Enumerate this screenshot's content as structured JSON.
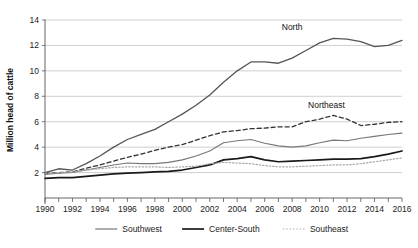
{
  "chart_data": {
    "type": "line",
    "title": "",
    "xlabel": "",
    "ylabel": "Million head of cattle",
    "xlim": [
      1990,
      2016
    ],
    "ylim": [
      0,
      14
    ],
    "yticks": [
      2,
      4,
      6,
      8,
      10,
      12,
      14
    ],
    "xticks": [
      1990,
      1992,
      1994,
      1996,
      1998,
      2000,
      2002,
      2004,
      2006,
      2008,
      2010,
      2012,
      2014,
      2016
    ],
    "grid": "horizontal",
    "legend_position": "bottom",
    "x": [
      1990,
      1991,
      1992,
      1993,
      1994,
      1995,
      1996,
      1997,
      1998,
      1999,
      2000,
      2001,
      2002,
      2003,
      2004,
      2005,
      2006,
      2007,
      2008,
      2009,
      2010,
      2011,
      2012,
      2013,
      2014,
      2015,
      2016
    ],
    "series": [
      {
        "name": "North",
        "label_in_chart": "North",
        "color": "#555555",
        "style": "solid",
        "width": 1.3,
        "values": [
          2.0,
          2.3,
          2.2,
          2.7,
          3.3,
          4.0,
          4.6,
          5.0,
          5.4,
          6.0,
          6.6,
          7.3,
          8.1,
          9.1,
          10.0,
          10.7,
          10.7,
          10.6,
          11.0,
          11.6,
          12.2,
          12.55,
          12.5,
          12.3,
          11.9,
          12.0,
          12.4
        ]
      },
      {
        "name": "Northeast",
        "label_in_chart": "Northeast",
        "color": "#333333",
        "style": "dashed",
        "width": 1.3,
        "values": [
          1.95,
          2.0,
          2.05,
          2.35,
          2.6,
          2.9,
          3.2,
          3.45,
          3.75,
          4.0,
          4.2,
          4.55,
          4.9,
          5.2,
          5.3,
          5.45,
          5.5,
          5.6,
          5.6,
          6.0,
          6.2,
          6.5,
          6.2,
          5.7,
          5.8,
          5.95,
          6.0
        ]
      },
      {
        "name": "Southwest",
        "color": "#777777",
        "style": "solid",
        "width": 1.1,
        "values": [
          1.85,
          1.95,
          2.0,
          2.2,
          2.4,
          2.6,
          2.75,
          2.7,
          2.7,
          2.8,
          3.0,
          3.3,
          3.7,
          4.35,
          4.5,
          4.6,
          4.3,
          4.1,
          4.0,
          4.1,
          4.35,
          4.55,
          4.5,
          4.7,
          4.85,
          5.0,
          5.1
        ]
      },
      {
        "name": "Center-South",
        "color": "#1a1a1a",
        "style": "solid",
        "width": 1.7,
        "values": [
          1.55,
          1.6,
          1.6,
          1.7,
          1.8,
          1.9,
          1.95,
          2.0,
          2.05,
          2.1,
          2.2,
          2.4,
          2.6,
          3.0,
          3.1,
          3.25,
          3.0,
          2.85,
          2.9,
          2.95,
          3.0,
          3.05,
          3.05,
          3.1,
          3.25,
          3.45,
          3.7
        ]
      },
      {
        "name": "Southeast",
        "color": "#a8a8a8",
        "style": "dotted",
        "width": 1.2,
        "values": [
          1.95,
          2.0,
          2.05,
          2.2,
          2.3,
          2.4,
          2.45,
          2.45,
          2.45,
          2.4,
          2.45,
          2.5,
          2.7,
          2.8,
          2.75,
          2.7,
          2.55,
          2.45,
          2.45,
          2.5,
          2.55,
          2.6,
          2.6,
          2.7,
          2.85,
          3.0,
          3.15
        ]
      }
    ],
    "annotations": [
      {
        "text": "North",
        "x": 2008,
        "y": 13.2
      },
      {
        "text": "Northeast",
        "x": 2010.5,
        "y": 7.1
      }
    ],
    "legend": [
      {
        "label": "Southwest",
        "color": "#777777",
        "style": "solid"
      },
      {
        "label": "Center-South",
        "color": "#1a1a1a",
        "style": "solid"
      },
      {
        "label": "Southeast",
        "color": "#a8a8a8",
        "style": "dotted"
      }
    ]
  }
}
